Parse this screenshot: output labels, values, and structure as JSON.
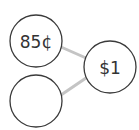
{
  "diagram": {
    "type": "number-bond",
    "colors": {
      "circle_stroke": "#3a3a3a",
      "connector": "#c4c4c4",
      "text": "#333333"
    },
    "whole": {
      "label": "$1"
    },
    "parts": [
      {
        "label": "85¢"
      },
      {
        "label": ""
      }
    ]
  }
}
